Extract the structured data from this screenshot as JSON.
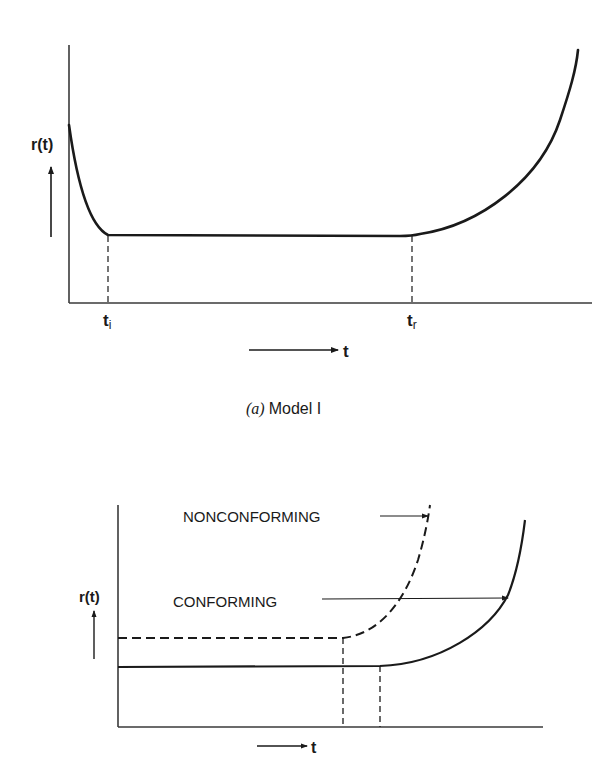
{
  "figure_a": {
    "y_label": "r(t)",
    "x_label": "t",
    "tick_ti_main": "t",
    "tick_ti_sub": "i",
    "tick_tr_main": "t",
    "tick_tr_sub": "r",
    "caption_letter": "(a)",
    "caption_text": "Model I",
    "curve": "bathtub hazard curve: decreasing early failures until t_i, constant rate until t_r, then increasing wear-out"
  },
  "figure_b": {
    "y_label": "r(t)",
    "x_label": "t",
    "nonconforming_label": "NONCONFORMING",
    "conforming_label": "CONFORMING",
    "curves": [
      {
        "name": "NONCONFORMING",
        "style": "dashed",
        "level": "higher constant rate, earlier wear-out"
      },
      {
        "name": "CONFORMING",
        "style": "solid",
        "level": "lower constant rate, later wear-out"
      }
    ]
  },
  "colors": {
    "ink": "#1a1a1a",
    "axis": "#3a3a3a",
    "background": "#ffffff"
  }
}
